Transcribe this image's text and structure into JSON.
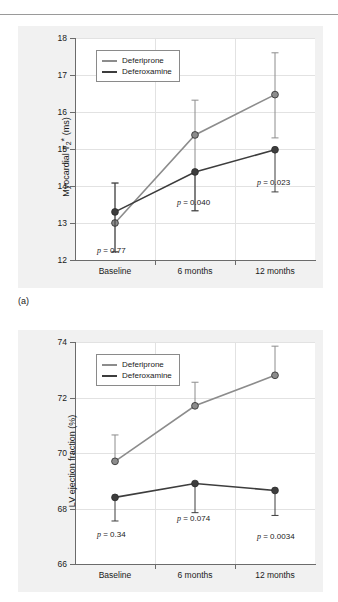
{
  "figure": {
    "subfigure_labels": {
      "a": "(a)"
    }
  },
  "legend": {
    "entries": [
      {
        "label": "Deferiprone",
        "color": "#8c8c8c"
      },
      {
        "label": "Deferoxamine",
        "color": "#3d3d3d"
      }
    ]
  },
  "colors": {
    "deferiprone": "#8c8c8c",
    "deferoxamine": "#3d3d3d",
    "panel_background": "#f1f1f1",
    "plot_background": "#ffffff",
    "axis": "#6b6b6b",
    "grid": "#e2e2e2"
  },
  "chart_data": [
    {
      "id": "chart-a",
      "type": "line",
      "title": "",
      "xlabel": "",
      "ylabel": "Myocardial T2* (ms)",
      "categories": [
        "Baseline",
        "6 months",
        "12 months"
      ],
      "ylim": [
        12,
        18
      ],
      "yticks": [
        12,
        13,
        14,
        15,
        16,
        17,
        18
      ],
      "grid": true,
      "legend_position": "top-left",
      "series": [
        {
          "name": "Deferiprone",
          "color": "#8c8c8c",
          "values": [
            13.0,
            15.38,
            16.47
          ],
          "err_low": [
            12.22,
            13.33,
            15.3
          ],
          "err_high": [
            14.08,
            16.32,
            17.6
          ]
        },
        {
          "name": "Deferoxamine",
          "color": "#3d3d3d",
          "values": [
            13.3,
            14.38,
            14.98
          ],
          "err_low": [
            12.22,
            13.33,
            13.84
          ],
          "err_high": [
            14.08,
            14.38,
            14.98
          ]
        }
      ],
      "annotations": [
        {
          "text": "p = 0.77",
          "category": "Baseline"
        },
        {
          "text": "p = 0.040",
          "category": "6 months"
        },
        {
          "text": "p = 0.023",
          "category": "12 months"
        }
      ]
    },
    {
      "id": "chart-b",
      "type": "line",
      "title": "",
      "xlabel": "",
      "ylabel": "LV ejection fraction (%)",
      "categories": [
        "Baseline",
        "6 months",
        "12 months"
      ],
      "ylim": [
        66,
        74
      ],
      "yticks": [
        66,
        68,
        70,
        72,
        74
      ],
      "grid": true,
      "legend_position": "top-left",
      "series": [
        {
          "name": "Deferiprone",
          "color": "#8c8c8c",
          "values": [
            69.7,
            71.7,
            72.8
          ],
          "err_low": [
            69.7,
            71.7,
            72.8
          ],
          "err_high": [
            70.65,
            72.55,
            73.85
          ]
        },
        {
          "name": "Deferoxamine",
          "color": "#3d3d3d",
          "values": [
            68.4,
            68.9,
            68.65
          ],
          "err_low": [
            67.55,
            67.85,
            67.75
          ],
          "err_high": [
            68.4,
            68.9,
            68.65
          ]
        }
      ],
      "annotations": [
        {
          "text": "p = 0.34",
          "category": "Baseline"
        },
        {
          "text": "p = 0.074",
          "category": "6 months"
        },
        {
          "text": "p = 0.0034",
          "category": "12 months"
        }
      ]
    }
  ],
  "axis_labels": {
    "chart_a_y_main": "Myocardial T",
    "chart_a_y_sub": "2",
    "chart_a_y_star": "*",
    "chart_a_y_unit": " (ms)",
    "chart_b_y": "LV ejection fraction (%)"
  },
  "pvalues": {
    "a": [
      "p = 0.77",
      "p = 0.040",
      "p = 0.023"
    ],
    "b": [
      "p = 0.34",
      "p = 0.074",
      "p = 0.0034"
    ]
  },
  "xtick_labels": [
    "Baseline",
    "6 months",
    "12 months"
  ]
}
